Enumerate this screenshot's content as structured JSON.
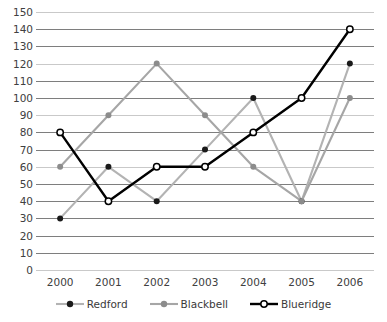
{
  "chart_data": {
    "type": "line",
    "title": "",
    "xlabel": "",
    "ylabel": "",
    "categories": [
      "2000",
      "2001",
      "2002",
      "2003",
      "2004",
      "2005",
      "2006"
    ],
    "x": [
      2000,
      2001,
      2002,
      2003,
      2004,
      2005,
      2006
    ],
    "ylim": [
      0,
      150
    ],
    "ytick_step": 10,
    "yticks": [
      0,
      10,
      20,
      30,
      40,
      50,
      60,
      70,
      80,
      90,
      100,
      110,
      120,
      130,
      140,
      150
    ],
    "grid": true,
    "legend_position": "bottom",
    "series": [
      {
        "name": "Redford",
        "values": [
          30,
          60,
          40,
          70,
          100,
          40,
          120
        ],
        "line_color": "#b3b3b3",
        "marker": "filled-circle",
        "marker_color": "#1a1a1a"
      },
      {
        "name": "Blackbell",
        "values": [
          60,
          90,
          120,
          90,
          60,
          40,
          100
        ],
        "line_color": "#a6a6a6",
        "marker": "filled-circle",
        "marker_color": "#8c8c8c"
      },
      {
        "name": "Blueridge",
        "values": [
          80,
          40,
          60,
          60,
          80,
          100,
          140
        ],
        "line_color": "#000000",
        "marker": "open-circle",
        "marker_color": "#ffffff"
      }
    ]
  },
  "axis": {
    "y_labels": [
      "150",
      "140",
      "130",
      "120",
      "110",
      "100",
      "90",
      "80",
      "70",
      "60",
      "50",
      "40",
      "30",
      "20",
      "10",
      "0"
    ],
    "x_labels": [
      "2000",
      "2001",
      "2002",
      "2003",
      "2004",
      "2005",
      "2006"
    ]
  },
  "legend": {
    "items": [
      {
        "label": "Redford"
      },
      {
        "label": "Blackbell"
      },
      {
        "label": "Blueridge"
      }
    ]
  },
  "colors": {
    "gridline": "#7e7e7e",
    "gridline_faint": "#c9c9c9",
    "text": "#404040",
    "redford_line": "#b3b3b3",
    "blackbell_line": "#a6a6a6",
    "blueridge_line": "#000000"
  }
}
